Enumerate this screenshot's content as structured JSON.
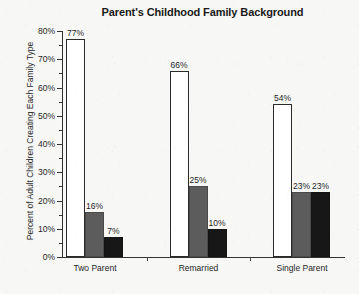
{
  "chart_data": {
    "type": "bar",
    "title": "Parent's Childhood Family Background",
    "xlabel": "",
    "ylabel": "Percent of Adult Children Creating Each Family Type",
    "categories": [
      "Two Parent",
      "Remarried",
      "Single Parent"
    ],
    "series": [
      {
        "name": "series-1",
        "color": "#ffffff",
        "values": [
          77,
          66,
          54
        ],
        "labels": [
          "77%",
          "66%",
          "54%"
        ]
      },
      {
        "name": "series-2",
        "color": "#5c5c5c",
        "values": [
          16,
          25,
          23
        ],
        "labels": [
          "16%",
          "25%",
          "23%"
        ]
      },
      {
        "name": "series-3",
        "color": "#171717",
        "values": [
          7,
          10,
          23
        ],
        "labels": [
          "7%",
          "10%",
          "23%"
        ]
      }
    ],
    "ylim": [
      0,
      80
    ],
    "ytick_step": 10,
    "yminor_step": 5,
    "ytick_labels": [
      "0%",
      "10%",
      "20%",
      "30%",
      "40%",
      "50%",
      "60%",
      "70%",
      "80%"
    ],
    "ytick_values": [
      0,
      10,
      20,
      30,
      40,
      50,
      60,
      70,
      80
    ],
    "grid": false,
    "legend": "none",
    "value_labels_shown": true
  },
  "colors": {
    "axis": "#333333",
    "text": "#1f1f1f",
    "background": "#f7f7f5",
    "bar_outline": "#2b2b2b"
  }
}
